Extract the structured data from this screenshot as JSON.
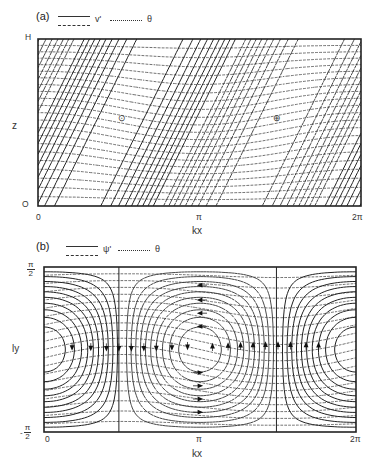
{
  "figure": {
    "panels": [
      {
        "id": "a",
        "label": "(a)",
        "legend": {
          "solid_dashed_symbol": "v'",
          "dotted_symbol": "θ"
        },
        "y_axis": {
          "title": "z",
          "ticks": [
            "O",
            "H"
          ]
        },
        "x_axis": {
          "title": "kx",
          "ticks": [
            "0",
            "π",
            "2π"
          ]
        },
        "markers": [
          {
            "symbol": "⊙",
            "name": "out-of-page",
            "kx_frac": 0.26,
            "z_frac": 0.52
          },
          {
            "symbol": "⊕",
            "name": "into-page",
            "kx_frac": 0.74,
            "z_frac": 0.52
          }
        ]
      },
      {
        "id": "b",
        "label": "(b)",
        "legend": {
          "solid_dashed_symbol": "ψ'",
          "dotted_symbol": "θ"
        },
        "y_axis": {
          "title": "ly",
          "ticks": [
            "-π/2",
            "π/2"
          ],
          "tick_top": {
            "num": "π",
            "den": "2",
            "sign": ""
          },
          "tick_bottom": {
            "num": "π",
            "den": "2",
            "sign": "-"
          }
        },
        "x_axis": {
          "title": "kx",
          "ticks": [
            "0",
            "π",
            "2π"
          ]
        },
        "vertical_lines_kx_frac": [
          0.24,
          0.745
        ],
        "arrows": {
          "down_row_left": [
            0.09,
            0.15,
            0.2,
            0.24,
            0.28,
            0.32,
            0.36,
            0.41,
            0.46
          ],
          "up_row_right": [
            0.54,
            0.59,
            0.63,
            0.67,
            0.71,
            0.75,
            0.79,
            0.84,
            0.88
          ],
          "left_col_top_y": [
            0.11,
            0.2,
            0.28,
            0.36
          ],
          "right_col_bottom_y": [
            0.64,
            0.72,
            0.8,
            0.88
          ]
        }
      }
    ]
  }
}
